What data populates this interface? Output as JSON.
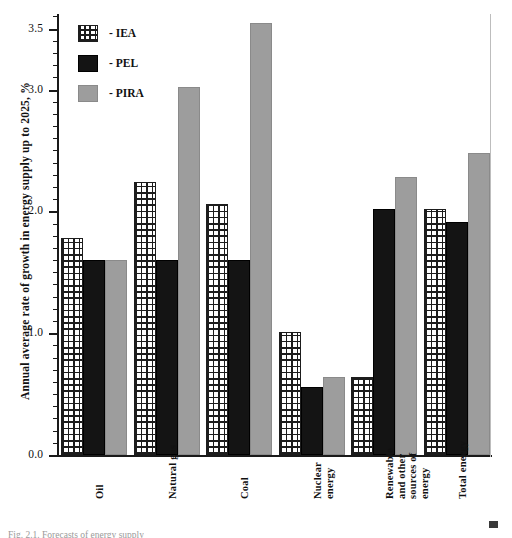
{
  "chart_data": {
    "type": "bar",
    "title": "",
    "xlabel": "",
    "ylabel": "Annual average rate of growth in energy supply up to 2025, %",
    "ylim": [
      0.0,
      3.62
    ],
    "grid": false,
    "legend_position": "top-left",
    "categories": [
      "Oil",
      "Natural gas",
      "Coal",
      "Nuclear\nenergy",
      "Renewable\nand other\nsources of\nenergy",
      "Total energy"
    ],
    "series": [
      {
        "name": "IEA",
        "values": [
          1.78,
          2.24,
          2.06,
          1.01,
          0.64,
          2.02
        ]
      },
      {
        "name": "PEL",
        "values": [
          1.6,
          1.6,
          1.6,
          0.56,
          2.02,
          1.91
        ]
      },
      {
        "name": "PIRA",
        "values": [
          1.6,
          3.02,
          3.55,
          0.64,
          2.28,
          2.48
        ]
      }
    ],
    "y_major_ticks": [
      0.0,
      1.0,
      2.0,
      3.0,
      3.5
    ],
    "y_major_tick_labels": [
      "0.0",
      "1.0",
      "2.0",
      "3.0",
      "3.5"
    ],
    "y_minor_tick_step": 0.1
  },
  "legend": {
    "items": [
      {
        "label": "- IEA",
        "key": "IEA",
        "swatch": "crosshatch-swatch",
        "color": "#ffffff"
      },
      {
        "label": "- PEL",
        "key": "PEL",
        "swatch": "solid-black-swatch",
        "color": "#141414"
      },
      {
        "label": "- PIRA",
        "key": "PIRA",
        "swatch": "solid-gray-swatch",
        "color": "#9d9d9d"
      }
    ]
  },
  "axes": {
    "y_title": "Annual average rate of growth in energy supply up to 2025, %"
  },
  "caption": {
    "text": "Fig. 2.1. Forecasts of energy supply"
  },
  "colors": {
    "axis": "#1a1a1a",
    "iea": "#ffffff",
    "pel": "#141414",
    "pira": "#9d9d9d",
    "text": "#111111"
  }
}
